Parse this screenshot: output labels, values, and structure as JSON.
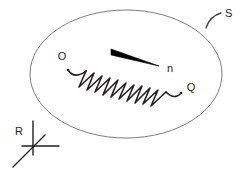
{
  "figure": {
    "background_color": "#ffffff",
    "ink_color": "#231f20",
    "outline_color": "#6e6e6e",
    "labels": {
      "surface": "S",
      "start_point": "O",
      "end_point": "Q",
      "normal_vector": "n",
      "reference_frame": "R"
    },
    "elements": {
      "surface_shape": "ellipse",
      "surface_leader": "curved-arc",
      "path_shape": "zigzag-spring",
      "vector_shape": "tapered-arrow",
      "frame_shape": "three-axis-cross"
    }
  },
  "geometry": {
    "ellipse": {
      "cx": 126,
      "cy": 74,
      "rx": 96,
      "ry": 64,
      "stroke_width": 0.9
    },
    "spring": {
      "start": [
        68,
        70
      ],
      "end": [
        180,
        93
      ],
      "peaks": 11,
      "stroke_width": 1.6
    },
    "arrow": {
      "tail": [
        112,
        51
      ],
      "tip": [
        158,
        66
      ],
      "tail_thickness": 5
    },
    "frame": {
      "origin": [
        33,
        146
      ],
      "up_axis_end": [
        33,
        121
      ],
      "right_axis_end": [
        58,
        146
      ],
      "diagonal_axis_end": [
        14,
        166
      ],
      "stroke_width": 1.4
    },
    "surface_leader": {
      "from": [
        206,
        27
      ],
      "to": [
        221,
        13
      ]
    },
    "label_positions": {
      "S": [
        225,
        17
      ],
      "O": [
        62,
        59
      ],
      "Q": [
        188,
        91
      ],
      "n": [
        169,
        70
      ],
      "R": [
        17,
        132
      ]
    }
  }
}
